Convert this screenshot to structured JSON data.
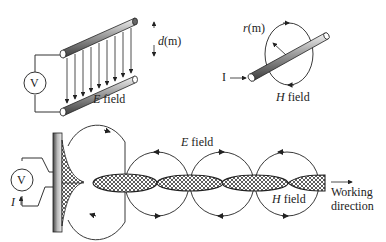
{
  "panel_e_field": {
    "source_symbol": "V",
    "distance_label_var": "d",
    "distance_label_unit": "(m)",
    "field_label_var": "E",
    "field_label_text": " field"
  },
  "panel_h_field": {
    "current_label": "I",
    "radius_label_var": "r",
    "radius_label_unit": "(m)",
    "field_label_var": "H",
    "field_label_text": " field"
  },
  "panel_wave": {
    "source_symbol": "V",
    "current_label": "I",
    "e_field_var": "E",
    "e_field_text": " field",
    "h_field_var": "H",
    "h_field_text": " field",
    "direction_line1": "Working",
    "direction_line2": "direction"
  },
  "colors": {
    "stroke": "#2a2a2a",
    "rod_dark": "#555555",
    "rod_light": "#f0f0f0"
  }
}
